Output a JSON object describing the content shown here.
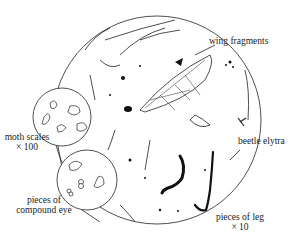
{
  "diagram": {
    "labels": {
      "wing_fragments": "wing fragments",
      "beetle_elytra": "beetle elytra",
      "moth_scales_line1": "moth scales",
      "moth_scales_line2": "× 100",
      "compound_eye_line1": "pieces of",
      "compound_eye_line2": "compound eye",
      "leg_line1": "pieces of leg",
      "leg_line2": "× 10"
    },
    "colors": {
      "ink": "#1a1a1a",
      "background": "#ffffff"
    }
  }
}
